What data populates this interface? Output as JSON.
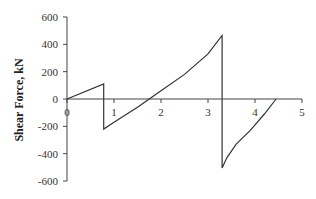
{
  "chart_data": {
    "type": "line",
    "title": "",
    "xlabel": "",
    "ylabel": "Shear Force, kN",
    "xlim": [
      0,
      5
    ],
    "ylim": [
      -600,
      600
    ],
    "x_ticks": [
      "0",
      "1",
      "2",
      "3",
      "4",
      "5"
    ],
    "y_ticks": [
      "600",
      "400",
      "200",
      "0",
      "-200",
      "-400",
      "-600"
    ],
    "grid": false,
    "legend": null,
    "series": [
      {
        "name": "Shear Force",
        "x": [
          0,
          0.78,
          0.78,
          1.0,
          1.5,
          2.0,
          2.5,
          3.0,
          3.3,
          3.3,
          3.4,
          3.6,
          3.9,
          4.2,
          4.45
        ],
        "y": [
          0,
          110,
          -220,
          -170,
          -60,
          60,
          180,
          330,
          465,
          -505,
          -430,
          -330,
          -230,
          -110,
          0
        ]
      }
    ],
    "line_color": "#333333"
  }
}
